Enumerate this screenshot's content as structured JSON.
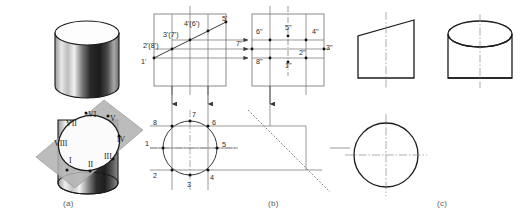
{
  "figure": {
    "captions": {
      "a": "(a)",
      "b": "(b)",
      "c": "(c)"
    },
    "colors": {
      "line": "#1b1b1b",
      "thin_line": "#6e6e6e",
      "center_line": "#8a8a8a",
      "plane_fill": "#b3b3b3",
      "caption_text": "#5a5a5a",
      "label_text": "#2b2b2b",
      "background": "#ffffff"
    }
  },
  "panel_a": {
    "name": "pictorial-view",
    "description": "Cylinder cut by an inclined plane showing elliptical section",
    "section_points": [
      {
        "label": "I",
        "x": 69,
        "y": 163
      },
      {
        "label": "II",
        "x": 88,
        "y": 167
      },
      {
        "label": "III",
        "x": 108,
        "y": 159
      },
      {
        "label": "IV",
        "x": 119,
        "y": 142
      },
      {
        "label": "V",
        "x": 113,
        "y": 121
      },
      {
        "label": "VI",
        "x": 93,
        "y": 117
      },
      {
        "label": "VII",
        "x": 73,
        "y": 124
      },
      {
        "label": "VIII",
        "x": 61,
        "y": 143
      }
    ]
  },
  "panel_b": {
    "name": "projection-construction-view",
    "description": "Front view, side view and top view with projection lines",
    "front_view_labels": [
      {
        "text": "1'",
        "x": 144,
        "y": 62
      },
      {
        "text": "2'(8')",
        "x": 145,
        "y": 47
      },
      {
        "text": "3'(7')",
        "x": 165,
        "y": 36
      },
      {
        "text": "4'(6')",
        "x": 187,
        "y": 25
      },
      {
        "text": "5'",
        "x": 214,
        "y": 20
      }
    ],
    "side_view_labels": [
      {
        "text": "6\"",
        "x": 258,
        "y": 33
      },
      {
        "text": "5\"",
        "x": 288,
        "y": 29
      },
      {
        "text": "4\"",
        "x": 315,
        "y": 33
      },
      {
        "text": "7\"",
        "x": 241,
        "y": 45
      },
      {
        "text": "3\"",
        "x": 325,
        "y": 48
      },
      {
        "text": "2\"",
        "x": 303,
        "y": 52
      },
      {
        "text": "8\"",
        "x": 259,
        "y": 62
      },
      {
        "text": "1\"",
        "x": 288,
        "y": 66
      }
    ],
    "top_view_labels": [
      {
        "text": "8",
        "x": 155,
        "y": 123
      },
      {
        "text": "7",
        "x": 193,
        "y": 115
      },
      {
        "text": "6",
        "x": 216,
        "y": 124
      },
      {
        "text": "1",
        "x": 145,
        "y": 148
      },
      {
        "text": "5",
        "x": 226,
        "y": 148
      },
      {
        "text": "2",
        "x": 155,
        "y": 176
      },
      {
        "text": "3",
        "x": 186,
        "y": 187
      },
      {
        "text": "4",
        "x": 212,
        "y": 178
      }
    ]
  },
  "panel_c": {
    "name": "finished-views",
    "description": "Completed three orthographic views of truncated cylinder",
    "views": [
      {
        "name": "front-view",
        "shape": "trapezoid-inclined-top"
      },
      {
        "name": "side-view",
        "shape": "cylinder-with-ellipse-top"
      },
      {
        "name": "top-view",
        "shape": "circle"
      }
    ]
  }
}
